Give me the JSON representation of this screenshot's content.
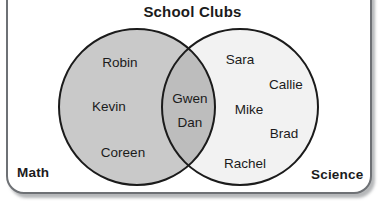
{
  "diagram": {
    "title": "School Clubs",
    "type": "venn-2-set",
    "left_set_label": "Math",
    "right_set_label": "Science",
    "colors": {
      "left_fill": "#c9c9c9",
      "right_fill": "#f2f2f2",
      "intersection_fill": "#bdbdbd",
      "outline": "#1b1b1b",
      "frame_border": "#6e7175",
      "text": "#1b1b1b",
      "background": "#ffffff"
    },
    "regions": {
      "left_only": {
        "set": "Math",
        "members": [
          "Robin",
          "Kevin",
          "Coreen"
        ],
        "count": 3
      },
      "intersection": {
        "set": "Math and Science",
        "members": [
          "Gwen",
          "Dan"
        ],
        "count": 2
      },
      "right_only": {
        "set": "Science",
        "members": [
          "Sara",
          "Callie",
          "Mike",
          "Brad",
          "Rachel"
        ],
        "count": 5
      }
    },
    "members_positioned": [
      {
        "name": "Robin",
        "region": "left_only",
        "x": 120,
        "y": 63
      },
      {
        "name": "Kevin",
        "region": "left_only",
        "x": 109,
        "y": 107
      },
      {
        "name": "Coreen",
        "region": "left_only",
        "x": 123,
        "y": 153
      },
      {
        "name": "Gwen",
        "region": "intersection",
        "x": 190,
        "y": 99
      },
      {
        "name": "Dan",
        "region": "intersection",
        "x": 190,
        "y": 123
      },
      {
        "name": "Sara",
        "region": "right_only",
        "x": 240,
        "y": 60
      },
      {
        "name": "Callie",
        "region": "right_only",
        "x": 286,
        "y": 85
      },
      {
        "name": "Mike",
        "region": "right_only",
        "x": 249,
        "y": 110
      },
      {
        "name": "Brad",
        "region": "right_only",
        "x": 284,
        "y": 134
      },
      {
        "name": "Rachel",
        "region": "right_only",
        "x": 245,
        "y": 164
      }
    ],
    "geometry": {
      "left_circle": {
        "cx": 137,
        "cy": 107,
        "r": 78
      },
      "right_circle": {
        "cx": 240,
        "cy": 107,
        "r": 78
      }
    }
  }
}
